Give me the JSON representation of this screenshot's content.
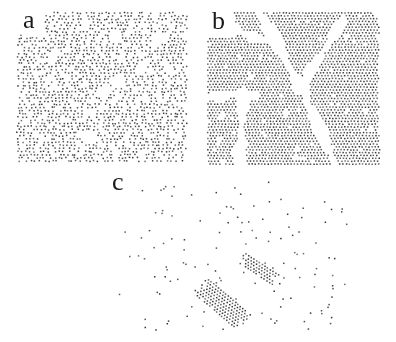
{
  "figure": {
    "background": "#ffffff",
    "dot_gray_min": 48,
    "dot_gray_max": 118,
    "dot_size": 1.5,
    "label_font_px": 26,
    "canvas_width": 396,
    "canvas_height": 342,
    "panels": [
      {
        "label": "a",
        "phase": "disordered-liquid-snapshot",
        "label_left": 23,
        "label_top": 7,
        "x": 18,
        "y": 13,
        "w": 170,
        "h": 151,
        "dx": 3.7,
        "dy": 3.15,
        "jitter_x": 1.15,
        "jitter_y": 0.55,
        "occupancy": 0.74,
        "void_count": 13,
        "void_r_min": 3,
        "void_r_max": 8,
        "label_clear_w": 26,
        "label_clear_h": 22,
        "edge_jitter": 4,
        "seed": 11
      },
      {
        "label": "b",
        "phase": "polycrystal-with-grain-boundaries",
        "label_left": 212,
        "label_top": 8,
        "x": 208,
        "y": 13,
        "w": 172,
        "h": 152,
        "dx": 3.25,
        "dy": 2.85,
        "jitter_x": 0.3,
        "jitter_y": 0.25,
        "occupancy": 0.985,
        "cracks": [
          [
            258,
            10,
            301,
            88,
            11
          ],
          [
            301,
            88,
            338,
            170,
            10
          ],
          [
            342,
            22,
            304,
            82,
            8
          ],
          [
            243,
            92,
            239,
            172,
            9
          ],
          [
            204,
            97,
            245,
            94,
            8
          ],
          [
            236,
            30,
            262,
            41,
            9
          ],
          [
            377,
            11,
            385,
            26,
            7
          ]
        ],
        "vacancy_count": 26,
        "vacancy_r_min": 1.2,
        "vacancy_r_max": 3.4,
        "big_vacancy_count": 5,
        "big_vacancy_r_max": 5,
        "label_clear_w": 26,
        "label_clear_h": 25,
        "edge_jitter": 3,
        "seed": 23
      },
      {
        "label": "c",
        "phase": "gas-with-crystalline-clusters",
        "label_left": 112,
        "label_top": 169,
        "x": 113,
        "y": 182,
        "w": 235,
        "h": 148,
        "dx": 3.2,
        "dy": 2.8,
        "gas_count": 124,
        "pair_chance": 0.12,
        "min_gap": 5.5,
        "clusters": [
          {
            "cx": 222,
            "cy": 303,
            "len": 60,
            "wid": 24,
            "angle_deg": 40
          },
          {
            "cx": 259,
            "cy": 268,
            "len": 40,
            "wid": 15,
            "angle_deg": 33
          }
        ],
        "seed": 5
      }
    ]
  }
}
